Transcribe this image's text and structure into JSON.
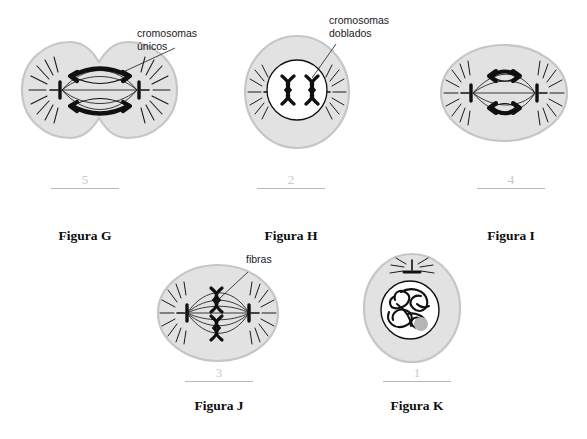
{
  "page": {
    "background_color": "#ffffff",
    "cell_fill_color": "#e2e2e2",
    "cell_stroke_color": "#c6c6c6",
    "nucleus_fill_color": "#ffffff",
    "ink_color": "#101010",
    "number_color": "#c9c9c9",
    "rule_color": "#b9b9b9"
  },
  "annotations": [
    {
      "id": "cromosomas-unicos",
      "line1": "cromosomas",
      "line2": "únicos"
    },
    {
      "id": "cromosomas-doblados",
      "line1": "cromosomas",
      "line2": "doblados"
    },
    {
      "id": "fibras",
      "line1": "fibras",
      "line2": ""
    }
  ],
  "figures": [
    {
      "id": "figura-g",
      "label": "Figura G",
      "number": "5",
      "phase": "telofase",
      "shape": "dividing-cell",
      "chromosome_count": 2,
      "chromosome_type": "single",
      "has_nucleus": false,
      "has_spindle": true,
      "has_asters": true,
      "annotation": "cromosomas-unicos"
    },
    {
      "id": "figura-h",
      "label": "Figura H",
      "number": "2",
      "phase": "profase",
      "shape": "round-cell",
      "chromosome_count": 2,
      "chromosome_type": "doubled",
      "has_nucleus": true,
      "has_spindle": false,
      "has_asters": true,
      "annotation": "cromosomas-doblados"
    },
    {
      "id": "figura-i",
      "label": "Figura I",
      "number": "4",
      "phase": "anafase",
      "shape": "oval-cell",
      "chromosome_count": 2,
      "chromosome_type": "separating",
      "has_nucleus": false,
      "has_spindle": true,
      "has_asters": true,
      "annotation": ""
    },
    {
      "id": "figura-j",
      "label": "Figura J",
      "number": "3",
      "phase": "metafase",
      "shape": "oval-cell",
      "chromosome_count": 2,
      "chromosome_type": "doubled",
      "has_nucleus": false,
      "has_spindle": true,
      "has_asters": true,
      "annotation": "fibras"
    },
    {
      "id": "figura-k",
      "label": "Figura K",
      "number": "1",
      "phase": "interfase",
      "shape": "oval-cell",
      "chromosome_count": 0,
      "chromosome_type": "chromatin",
      "has_nucleus": true,
      "has_spindle": false,
      "has_asters": true,
      "annotation": ""
    }
  ]
}
